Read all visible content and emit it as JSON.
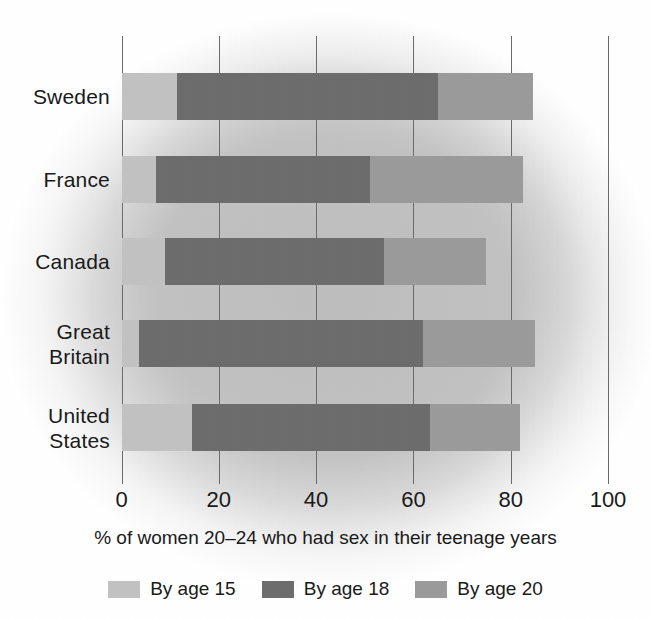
{
  "chart_data": {
    "type": "bar",
    "orientation": "horizontal",
    "stacked": true,
    "title": "",
    "xlabel": "% of women 20–24 who had sex in their teenage years",
    "ylabel": "",
    "xlim": [
      0,
      100
    ],
    "grid": true,
    "legend_position": "bottom",
    "categories": [
      "Sweden",
      "France",
      "Canada",
      "Great Britain",
      "United States"
    ],
    "tick_labels": [
      "0",
      "20",
      "40",
      "60",
      "80",
      "100"
    ],
    "tick_values": [
      0,
      20,
      40,
      60,
      80,
      100
    ],
    "series": [
      {
        "name": "By age 15",
        "color": "#c2c2c2",
        "values": [
          11.5,
          7,
          9,
          3.5,
          14.5
        ]
      },
      {
        "name": "By age 18",
        "color": "#6d6d6d",
        "values": [
          65,
          51,
          54,
          62,
          63.5
        ]
      },
      {
        "name": "By age 20",
        "color": "#9b9b9b",
        "values": [
          84.5,
          82.5,
          75,
          85,
          82
        ]
      }
    ],
    "note": "series values are cumulative totals read off the axis at each segment boundary"
  },
  "axis": {
    "title": "% of women 20–24 who had sex in their teenage years",
    "ticks": [
      {
        "label": "0",
        "value": 0
      },
      {
        "label": "20",
        "value": 20
      },
      {
        "label": "40",
        "value": 40
      },
      {
        "label": "60",
        "value": 60
      },
      {
        "label": "80",
        "value": 80
      },
      {
        "label": "100",
        "value": 100
      }
    ]
  },
  "categories": [
    {
      "label": "Sweden"
    },
    {
      "label": "France"
    },
    {
      "label": "Canada"
    },
    {
      "label": "Great\nBritain"
    },
    {
      "label": "United\nStates"
    }
  ],
  "legend": [
    {
      "label": "By age 15",
      "color": "#c2c2c2"
    },
    {
      "label": "By age 18",
      "color": "#6d6d6d"
    },
    {
      "label": "By age 20",
      "color": "#9b9b9b"
    }
  ]
}
